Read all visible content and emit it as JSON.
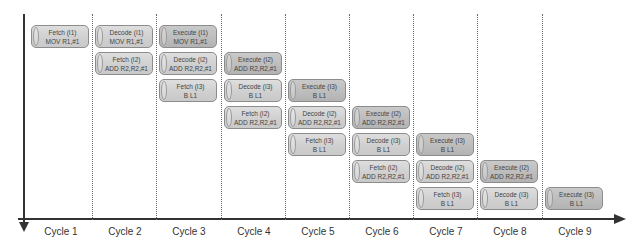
{
  "diagram": {
    "type": "pipeline-timing",
    "colors": {
      "fetch_decode": "#d3d3d3",
      "execute": "#bdbdbd",
      "axis": "#333333",
      "divider": "#6a6a6a"
    },
    "cycles": [
      "Cycle 1",
      "Cycle 2",
      "Cycle 3",
      "Cycle 4",
      "Cycle 5",
      "Cycle 6",
      "Cycle 7",
      "Cycle 8",
      "Cycle 9"
    ],
    "blocks": [
      {
        "cycle": 1,
        "row": 0,
        "stage": "Fetch (I1)",
        "instr": "MOV R1,#1",
        "kind": "fetch"
      },
      {
        "cycle": 2,
        "row": 0,
        "stage": "Decode (I1)",
        "instr": "MOV R1,#1",
        "kind": "decode"
      },
      {
        "cycle": 2,
        "row": 1,
        "stage": "Fetch (I2)",
        "instr": "ADD R2,R2,#1",
        "kind": "fetch"
      },
      {
        "cycle": 3,
        "row": 0,
        "stage": "Execute (I1)",
        "instr": "MOV R1,#1",
        "kind": "execute"
      },
      {
        "cycle": 3,
        "row": 1,
        "stage": "Decode (I2)",
        "instr": "ADD R2,R2,#1",
        "kind": "decode"
      },
      {
        "cycle": 3,
        "row": 2,
        "stage": "Fetch (I3)",
        "instr": "B  L1",
        "kind": "fetch"
      },
      {
        "cycle": 4,
        "row": 1,
        "stage": "Execute (I2)",
        "instr": "ADD R2,R2,#1",
        "kind": "execute"
      },
      {
        "cycle": 4,
        "row": 2,
        "stage": "Decode (I3)",
        "instr": "B  L1",
        "kind": "decode"
      },
      {
        "cycle": 4,
        "row": 3,
        "stage": "Fetch (I2)",
        "instr": "ADD R2,R2,#1",
        "kind": "fetch"
      },
      {
        "cycle": 5,
        "row": 2,
        "stage": "Execute (I3)",
        "instr": "B  L1",
        "kind": "execute"
      },
      {
        "cycle": 5,
        "row": 3,
        "stage": "Decode (I2)",
        "instr": "ADD R2,R2,#1",
        "kind": "decode"
      },
      {
        "cycle": 5,
        "row": 4,
        "stage": "Fetch (I3)",
        "instr": "B  L1",
        "kind": "fetch"
      },
      {
        "cycle": 6,
        "row": 3,
        "stage": "Execute (I2)",
        "instr": "ADD R2,R2,#1",
        "kind": "execute"
      },
      {
        "cycle": 6,
        "row": 4,
        "stage": "Decode (I3)",
        "instr": "B  L1",
        "kind": "decode"
      },
      {
        "cycle": 6,
        "row": 5,
        "stage": "Fetch (I2)",
        "instr": "ADD R2,R2,#1",
        "kind": "fetch"
      },
      {
        "cycle": 7,
        "row": 4,
        "stage": "Execute (I3)",
        "instr": "B  L1",
        "kind": "execute"
      },
      {
        "cycle": 7,
        "row": 5,
        "stage": "Decode (I2)",
        "instr": "ADD R2,R2,#1",
        "kind": "decode"
      },
      {
        "cycle": 7,
        "row": 6,
        "stage": "Fetch (I3)",
        "instr": "B  L1",
        "kind": "fetch"
      },
      {
        "cycle": 8,
        "row": 5,
        "stage": "Execute (I2)",
        "instr": "ADD R2,R2,#1",
        "kind": "execute"
      },
      {
        "cycle": 8,
        "row": 6,
        "stage": "Decode (I3)",
        "instr": "B  L1",
        "kind": "decode"
      },
      {
        "cycle": 9,
        "row": 6,
        "stage": "Execute (I3)",
        "instr": "B  L1",
        "kind": "execute"
      }
    ]
  }
}
